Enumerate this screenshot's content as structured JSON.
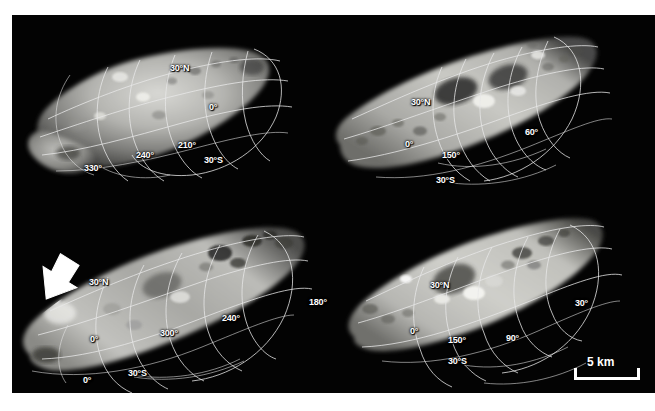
{
  "figure": {
    "kind": "four-panel asteroid imaging plate",
    "background_color": "#ffffff",
    "plate_color": "#030303",
    "grid_color": "#e8e8e8",
    "label_color": "#ffffff"
  },
  "panels": [
    {
      "id": "top-left",
      "name": "view-top-left",
      "labels": [
        {
          "text": "30°N",
          "x": 158,
          "y": 49
        },
        {
          "text": "0°",
          "x": 197,
          "y": 88
        },
        {
          "text": "210°",
          "x": 166,
          "y": 126
        },
        {
          "text": "240°",
          "x": 124,
          "y": 136
        },
        {
          "text": "30°S",
          "x": 192,
          "y": 141
        },
        {
          "text": "330°",
          "x": 72,
          "y": 149
        }
      ]
    },
    {
      "id": "top-right",
      "name": "view-top-right",
      "labels": [
        {
          "text": "30°N",
          "x": 399,
          "y": 83
        },
        {
          "text": "0°",
          "x": 393,
          "y": 125
        },
        {
          "text": "150°",
          "x": 430,
          "y": 136
        },
        {
          "text": "60°",
          "x": 513,
          "y": 113
        },
        {
          "text": "30°S",
          "x": 424,
          "y": 161
        }
      ]
    },
    {
      "id": "bottom-left",
      "name": "view-bottom-left",
      "labels": [
        {
          "text": "30°N",
          "x": 77,
          "y": 263
        },
        {
          "text": "0°",
          "x": 78,
          "y": 320
        },
        {
          "text": "300°",
          "x": 148,
          "y": 314
        },
        {
          "text": "240°",
          "x": 210,
          "y": 299
        },
        {
          "text": "180°",
          "x": 297,
          "y": 283
        },
        {
          "text": "30°S",
          "x": 116,
          "y": 354
        },
        {
          "text": "0°",
          "x": 71,
          "y": 361
        }
      ],
      "annotation": {
        "name": "white-arrow",
        "x": 32,
        "y": 246,
        "points_to": "bright-spot-on-limb"
      }
    },
    {
      "id": "bottom-right",
      "name": "view-bottom-right",
      "labels": [
        {
          "text": "30°N",
          "x": 418,
          "y": 276
        },
        {
          "text": "0°",
          "x": 398,
          "y": 322
        },
        {
          "text": "150°",
          "x": 436,
          "y": 331
        },
        {
          "text": "90°",
          "x": 494,
          "y": 329
        },
        {
          "text": "30°",
          "x": 563,
          "y": 294
        },
        {
          "text": "30°S",
          "x": 436,
          "y": 352
        }
      ]
    }
  ],
  "scalebar": {
    "name": "scale-bar",
    "label": "5 km",
    "x": 572,
    "y": 366,
    "bar_width": 62
  }
}
